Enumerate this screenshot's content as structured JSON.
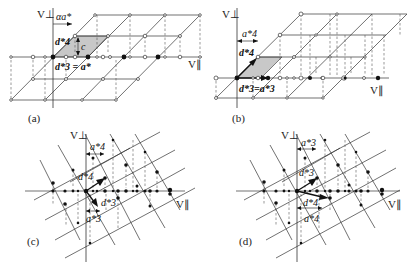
{
  "figure": {
    "panels": [
      {
        "id": "a",
        "label": "(a)",
        "axis_perp": "V⊥",
        "axis_par": "V∥",
        "annotations": {
          "shift": "αa*",
          "d4": "d*4",
          "d3_eq": "d*3 = a*",
          "c": "c"
        }
      },
      {
        "id": "b",
        "label": "(b)",
        "axis_perp": "V⊥",
        "axis_par": "V∥",
        "annotations": {
          "shift": "a*4",
          "d4": "d*4",
          "d3_eq": "d*3=a*3"
        }
      },
      {
        "id": "c",
        "label": "(c)",
        "axis_perp": "V⊥",
        "axis_par": "V∥",
        "annotations": {
          "a4": "a*4",
          "d4": "d*4",
          "d3": "d*3",
          "a3": "a*3"
        }
      },
      {
        "id": "d",
        "label": "(d)",
        "axis_perp": "V⊥",
        "axis_par": "V∥",
        "annotations": {
          "a3": "a*3",
          "d3": "d*3",
          "d4": "d*4",
          "a4": "a*4"
        }
      }
    ]
  }
}
